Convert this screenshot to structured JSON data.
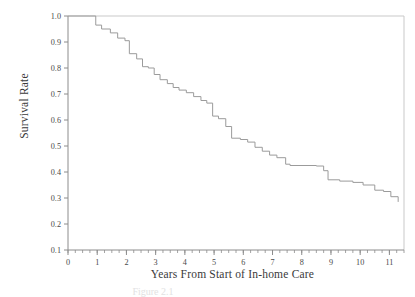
{
  "figure": {
    "caption": "Figure 2.1",
    "background": "#ffffff"
  },
  "axis_titles": {
    "y": "Survival Rate",
    "x": "Years From Start of In-home Care"
  },
  "colors": {
    "curve": "#9b9b9b",
    "axis": "#8c8c8c",
    "frame": "#c9c9c9",
    "text": "#3a3a3a"
  },
  "chart_data": {
    "type": "line",
    "title": "",
    "subtitle": "",
    "xlabel": "Years From Start of In-home Care",
    "ylabel": "Survival Rate",
    "xlim": [
      0,
      11.5
    ],
    "ylim": [
      0.1,
      1.0
    ],
    "grid": false,
    "legend": null,
    "x_ticks": [
      0,
      1,
      2,
      3,
      4,
      5,
      6,
      7,
      8,
      9,
      10,
      11
    ],
    "x_tick_labels": [
      "0",
      "1",
      "2",
      "3",
      "4",
      "5",
      "6",
      "7",
      "8",
      "9",
      "10",
      "11"
    ],
    "x_minor_tick_interval": 0.25,
    "y_ticks": [
      0.1,
      0.2,
      0.3,
      0.4,
      0.5,
      0.6,
      0.7,
      0.8,
      0.9,
      1.0
    ],
    "y_tick_labels": [
      "0.1",
      "0.2",
      "0.3",
      "0.4",
      "0.5",
      "0.6",
      "0.7",
      "0.8",
      "0.9",
      "1.0"
    ],
    "series": [
      {
        "name": "Survival Rate",
        "style": "step",
        "color": "#9b9b9b",
        "x": [
          0.0,
          0.75,
          0.95,
          1.15,
          1.45,
          1.7,
          1.95,
          2.1,
          2.35,
          2.55,
          2.75,
          2.95,
          3.15,
          3.4,
          3.6,
          3.8,
          4.05,
          4.3,
          4.55,
          4.75,
          4.95,
          5.15,
          5.4,
          5.6,
          5.9,
          6.15,
          6.4,
          6.65,
          6.9,
          7.15,
          7.45,
          7.6,
          8.5,
          8.75,
          8.9,
          9.3,
          9.75,
          10.1,
          10.5,
          10.8,
          11.05,
          11.3
        ],
        "y": [
          1.0,
          1.0,
          0.965,
          0.95,
          0.935,
          0.915,
          0.905,
          0.855,
          0.835,
          0.805,
          0.8,
          0.775,
          0.755,
          0.74,
          0.725,
          0.715,
          0.705,
          0.69,
          0.675,
          0.665,
          0.615,
          0.605,
          0.575,
          0.53,
          0.525,
          0.515,
          0.495,
          0.48,
          0.465,
          0.455,
          0.43,
          0.425,
          0.423,
          0.405,
          0.37,
          0.365,
          0.36,
          0.35,
          0.33,
          0.325,
          0.305,
          0.285
        ],
        "endpoint": {
          "x": 11.3,
          "y": 0.285
        }
      }
    ]
  }
}
